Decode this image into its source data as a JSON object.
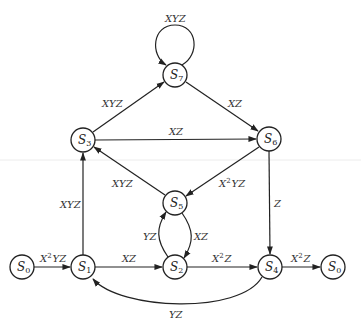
{
  "diagram": {
    "type": "state-transition-diagram",
    "nodes": [
      {
        "id": "S0_left",
        "label": "S",
        "sub": "0",
        "x": 22,
        "y": 267
      },
      {
        "id": "S1",
        "label": "S",
        "sub": "1",
        "x": 83,
        "y": 267
      },
      {
        "id": "S2",
        "label": "S",
        "sub": "2",
        "x": 175,
        "y": 267
      },
      {
        "id": "S3",
        "label": "S",
        "sub": "3",
        "x": 83,
        "y": 140
      },
      {
        "id": "S4",
        "label": "S",
        "sub": "4",
        "x": 270,
        "y": 267
      },
      {
        "id": "S5",
        "label": "S",
        "sub": "5",
        "x": 175,
        "y": 203
      },
      {
        "id": "S6",
        "label": "S",
        "sub": "6",
        "x": 269,
        "y": 139
      },
      {
        "id": "S7",
        "label": "S",
        "sub": "7",
        "x": 175,
        "y": 75
      },
      {
        "id": "S0_right",
        "label": "S",
        "sub": "0",
        "x": 333,
        "y": 267
      }
    ],
    "edges": [
      {
        "from": "S7",
        "to": "S7",
        "label": "XYZ",
        "kind": "self-loop"
      },
      {
        "from": "S3",
        "to": "S7",
        "label": "XYZ"
      },
      {
        "from": "S7",
        "to": "S6",
        "label": "XZ"
      },
      {
        "from": "S3",
        "to": "S6",
        "label": "XZ"
      },
      {
        "from": "S5",
        "to": "S3",
        "label": "XYZ"
      },
      {
        "from": "S6",
        "to": "S5",
        "label_base": "X",
        "label_sup": "2",
        "label_rest": "YZ"
      },
      {
        "from": "S6",
        "to": "S4",
        "label": "Z"
      },
      {
        "from": "S1",
        "to": "S3",
        "label": "XYZ"
      },
      {
        "from": "S2",
        "to": "S5",
        "label": "YZ"
      },
      {
        "from": "S5",
        "to": "S2",
        "label": "XZ"
      },
      {
        "from": "S0_left",
        "to": "S1",
        "label_base": "X",
        "label_sup": "2",
        "label_rest": "YZ"
      },
      {
        "from": "S1",
        "to": "S2",
        "label": "XZ"
      },
      {
        "from": "S2",
        "to": "S4",
        "label_base": "X",
        "label_sup": "2",
        "label_rest": "Z"
      },
      {
        "from": "S4",
        "to": "S0_right",
        "label_base": "X",
        "label_sup": "2",
        "label_rest": "Z"
      },
      {
        "from": "S4",
        "to": "S1",
        "label": "YZ",
        "kind": "curved-below"
      }
    ]
  },
  "labels": {
    "s7_loop": "XYZ",
    "s3_s7": "XYZ",
    "s7_s6": "XZ",
    "s3_s6": "XZ",
    "s5_s3": "XYZ",
    "s6_s5": {
      "base": "X",
      "sup": "2",
      "rest": "YZ"
    },
    "s6_s4": "Z",
    "s1_s3": "XYZ",
    "s2_s5": "YZ",
    "s5_s2": "XZ",
    "s0_s1": {
      "base": "X",
      "sup": "2",
      "rest": "YZ"
    },
    "s1_s2": "XZ",
    "s2_s4": {
      "base": "X",
      "sup": "2",
      "rest": "Z"
    },
    "s4_s0": {
      "base": "X",
      "sup": "2",
      "rest": "Z"
    },
    "s4_s1": "YZ"
  },
  "nodes": {
    "s0_left": {
      "label": "S",
      "sub": "0"
    },
    "s1": {
      "label": "S",
      "sub": "1"
    },
    "s2": {
      "label": "S",
      "sub": "2"
    },
    "s3": {
      "label": "S",
      "sub": "3"
    },
    "s4": {
      "label": "S",
      "sub": "4"
    },
    "s5": {
      "label": "S",
      "sub": "5"
    },
    "s6": {
      "label": "S",
      "sub": "6"
    },
    "s7": {
      "label": "S",
      "sub": "7"
    },
    "s0_right": {
      "label": "S",
      "sub": "0"
    }
  }
}
